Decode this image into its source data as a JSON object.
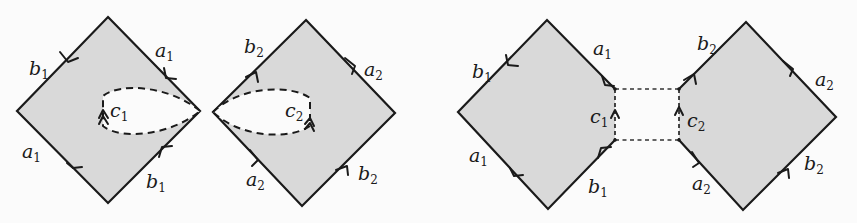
{
  "figure": {
    "panels": [
      {
        "name": "left-pair",
        "polygons": [
          {
            "name": "genus1-square-1",
            "edges": [
              {
                "label": "b",
                "sub": "1",
                "side": "top-left"
              },
              {
                "label": "a",
                "sub": "1",
                "side": "top-right"
              },
              {
                "label": "a",
                "sub": "1",
                "side": "bottom-left"
              },
              {
                "label": "b",
                "sub": "1",
                "side": "bottom-right"
              }
            ],
            "loop": {
              "label": "c",
              "sub": "1",
              "style": "dashed"
            }
          },
          {
            "name": "genus1-square-2",
            "edges": [
              {
                "label": "b",
                "sub": "2",
                "side": "top-left"
              },
              {
                "label": "a",
                "sub": "2",
                "side": "top-right"
              },
              {
                "label": "a",
                "sub": "2",
                "side": "bottom-left"
              },
              {
                "label": "b",
                "sub": "2",
                "side": "bottom-right"
              }
            ],
            "loop": {
              "label": "c",
              "sub": "2",
              "style": "dashed"
            }
          }
        ]
      },
      {
        "name": "right-pair",
        "polygons": [
          {
            "name": "pentagon-1",
            "edges": [
              {
                "label": "b",
                "sub": "1",
                "side": "top-left"
              },
              {
                "label": "a",
                "sub": "1",
                "side": "top-right"
              },
              {
                "label": "c",
                "sub": "1",
                "side": "right"
              },
              {
                "label": "a",
                "sub": "1",
                "side": "bottom-left"
              },
              {
                "label": "b",
                "sub": "1",
                "side": "bottom-right"
              }
            ]
          },
          {
            "name": "pentagon-2",
            "edges": [
              {
                "label": "b",
                "sub": "2",
                "side": "top-left"
              },
              {
                "label": "c",
                "sub": "2",
                "side": "left"
              },
              {
                "label": "a",
                "sub": "2",
                "side": "top-right"
              },
              {
                "label": "a",
                "sub": "2",
                "side": "bottom-left"
              },
              {
                "label": "b",
                "sub": "2",
                "side": "bottom-right"
              }
            ]
          }
        ],
        "connectors": "dashed lines joining endpoints of c1 and c2"
      }
    ],
    "labels": {
      "d1_b1_top": {
        "base": "b",
        "sub": "1"
      },
      "d1_a1_top": {
        "base": "a",
        "sub": "1"
      },
      "d1_c1": {
        "base": "c",
        "sub": "1"
      },
      "d1_a1_bot": {
        "base": "a",
        "sub": "1"
      },
      "d1_b1_bot": {
        "base": "b",
        "sub": "1"
      },
      "d2_b2_top": {
        "base": "b",
        "sub": "2"
      },
      "d2_a2_top": {
        "base": "a",
        "sub": "2"
      },
      "d2_c2": {
        "base": "c",
        "sub": "2"
      },
      "d2_a2_bot": {
        "base": "a",
        "sub": "2"
      },
      "d2_b2_bot": {
        "base": "b",
        "sub": "2"
      },
      "d3_b1_top": {
        "base": "b",
        "sub": "1"
      },
      "d3_a1_top": {
        "base": "a",
        "sub": "1"
      },
      "d3_c1": {
        "base": "c",
        "sub": "1"
      },
      "d3_a1_bot": {
        "base": "a",
        "sub": "1"
      },
      "d3_b1_bot": {
        "base": "b",
        "sub": "1"
      },
      "d4_b2_top": {
        "base": "b",
        "sub": "2"
      },
      "d4_a2_top": {
        "base": "a",
        "sub": "2"
      },
      "d4_c2": {
        "base": "c",
        "sub": "2"
      },
      "d4_a2_bot": {
        "base": "a",
        "sub": "2"
      },
      "d4_b2_bot": {
        "base": "b",
        "sub": "2"
      }
    },
    "colors": {
      "fill": "#d9d9d9",
      "stroke": "#1a1a1a",
      "background": "#fbfbfb"
    }
  }
}
